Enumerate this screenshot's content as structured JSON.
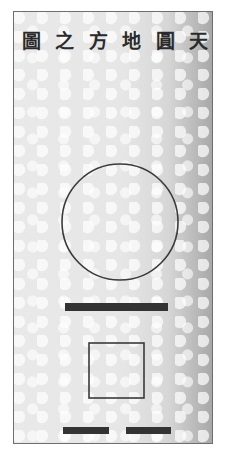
{
  "diagram": {
    "title_chars_ltr": [
      "圖",
      "之",
      "方",
      "地",
      "圓",
      "天"
    ],
    "title_reading_rtl": "天圓地方之圖",
    "shapes": {
      "circle": {
        "cx": 120,
        "cy": 222,
        "r": 58,
        "stroke": "#3a3a3a"
      },
      "long_bar": {
        "x": 65,
        "y": 303,
        "w": 103,
        "h": 8,
        "fill": "#333333"
      },
      "square": {
        "x": 89,
        "y": 343,
        "w": 55,
        "h": 55,
        "stroke": "#3a3a3a"
      },
      "short_bars": [
        {
          "x": 63,
          "y": 427,
          "w": 46,
          "h": 7,
          "fill": "#333333"
        },
        {
          "x": 126,
          "y": 427,
          "w": 45,
          "h": 7,
          "fill": "#333333"
        }
      ]
    }
  }
}
